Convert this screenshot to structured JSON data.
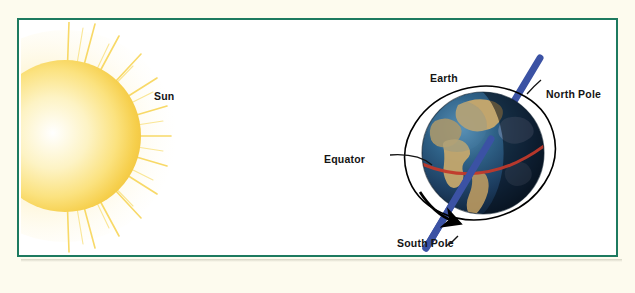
{
  "figure": {
    "frame_color": "#1d7a5f",
    "background_color": "#fdfbee",
    "panel_color": "#ffffff"
  },
  "labels": {
    "sun": "Sun",
    "earth": "Earth",
    "north_pole": "North Pole",
    "equator": "Equator",
    "south_pole": "South Pole"
  },
  "objects": {
    "sun": {
      "name": "sun",
      "core_color": "#ffffff",
      "mid_color": "#fde89a",
      "outer_color": "#f0c23a",
      "ray_color": "#f7d34e"
    },
    "earth": {
      "name": "earth",
      "ocean_color": "#1b3a5c",
      "land_color": "#c9a96b",
      "highlight_color": "#3f7fa8",
      "shadow_color": "#0a1622",
      "equator_line_color": "#c0392b",
      "axis_color": "#3b52a4",
      "orbit_arrow_color": "#000000"
    }
  }
}
